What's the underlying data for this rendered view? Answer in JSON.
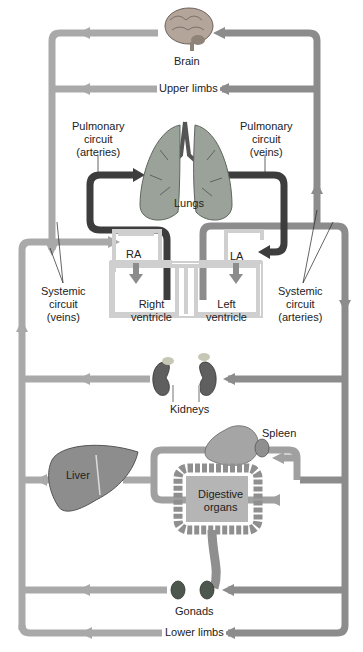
{
  "colors": {
    "systemic_veins": "#a9a9a9",
    "systemic_arteries": "#8c8c8c",
    "pulmonary": "#3d3d3d",
    "heart_wall": "#d0d0d0",
    "organ": "#8a8a8a"
  },
  "labels": {
    "brain": "Brain",
    "upper_limbs": "Upper limbs",
    "pulmonary_arteries_l1": "Pulmonary",
    "pulmonary_arteries_l2": "circuit",
    "pulmonary_arteries_l3": "(arteries)",
    "pulmonary_veins_l1": "Pulmonary",
    "pulmonary_veins_l2": "circuit",
    "pulmonary_veins_l3": "(veins)",
    "lungs": "Lungs",
    "ra": "RA",
    "la": "LA",
    "right_ventricle_l1": "Right",
    "right_ventricle_l2": "ventricle",
    "left_ventricle_l1": "Left",
    "left_ventricle_l2": "ventricle",
    "systemic_veins_l1": "Systemic",
    "systemic_veins_l2": "circuit",
    "systemic_veins_l3": "(veins)",
    "systemic_arteries_l1": "Systemic",
    "systemic_arteries_l2": "circuit",
    "systemic_arteries_l3": "(arteries)",
    "kidneys": "Kidneys",
    "spleen": "Spleen",
    "liver": "Liver",
    "digestive_l1": "Digestive",
    "digestive_l2": "organs",
    "gonads": "Gonads",
    "lower_limbs": "Lower limbs"
  }
}
